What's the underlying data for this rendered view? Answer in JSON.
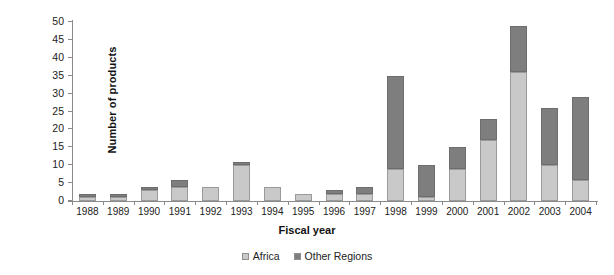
{
  "chart_data": {
    "type": "bar",
    "subtype": "stacked-bar",
    "title": "",
    "xlabel": "Fiscal year",
    "ylabel": "Number of products",
    "ylim": [
      0,
      50
    ],
    "yticks": [
      0,
      5,
      10,
      15,
      20,
      25,
      30,
      35,
      40,
      45,
      50
    ],
    "grid": false,
    "legend_position": "bottom-center",
    "categories": [
      "1988",
      "1989",
      "1990",
      "1991",
      "1992",
      "1993",
      "1994",
      "1995",
      "1996",
      "1997",
      "1998",
      "1999",
      "2000",
      "2001",
      "2002",
      "2003",
      "2004"
    ],
    "series": [
      {
        "name": "Africa",
        "color": "#c9c9c9",
        "values": [
          1,
          1,
          3,
          4,
          4,
          10,
          4,
          2,
          2,
          2,
          9,
          1,
          9,
          17,
          36,
          10,
          6
        ]
      },
      {
        "name": "Other Regions",
        "color": "#7e7e7e",
        "values": [
          1,
          1,
          1,
          2,
          0,
          1,
          0,
          0,
          1,
          2,
          26,
          9,
          6,
          6,
          13,
          16,
          23
        ]
      }
    ],
    "totals": [
      2,
      2,
      4,
      6,
      4,
      11,
      4,
      2,
      3,
      4,
      35,
      10,
      15,
      23,
      49,
      26,
      29
    ]
  },
  "legend": {
    "items": [
      {
        "label": "Africa",
        "color": "#c9c9c9"
      },
      {
        "label": "Other Regions",
        "color": "#7e7e7e"
      }
    ]
  },
  "colors": {
    "africa": "#c9c9c9",
    "other_regions": "#7e7e7e",
    "axis": "#8a8a8a",
    "text": "#222222",
    "background": "#ffffff"
  }
}
